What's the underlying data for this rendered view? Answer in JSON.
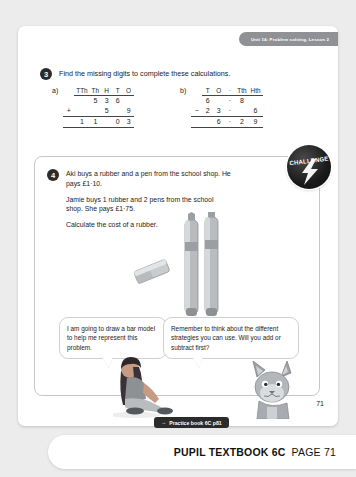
{
  "header": {
    "unit_tab": "Unit 14: Problem solving, Lesson 2"
  },
  "question3": {
    "number": "3",
    "prompt": "Find the missing digits to complete these calculations.",
    "parts": [
      {
        "label": "a)",
        "headers": [
          "TTh",
          "Th",
          "H",
          "T",
          "O"
        ],
        "rows": [
          {
            "op": "",
            "cells": [
              "",
              "5",
              "3",
              "6",
              ""
            ]
          },
          {
            "op": "+",
            "cells": [
              "",
              "",
              "5",
              "",
              "9"
            ]
          },
          {
            "op": "",
            "cells": [
              "1",
              "1",
              "",
              "0",
              "3"
            ]
          }
        ]
      },
      {
        "label": "b)",
        "headers": [
          "T",
          "O",
          "·",
          "Tth",
          "Hth"
        ],
        "rows": [
          {
            "op": "",
            "cells": [
              "6",
              "",
              "·",
              "8",
              ""
            ]
          },
          {
            "op": "−",
            "cells": [
              "2",
              "3",
              "·",
              "",
              "6"
            ]
          },
          {
            "op": "",
            "cells": [
              "",
              "6",
              "·",
              "2",
              "9"
            ]
          }
        ]
      }
    ]
  },
  "question4": {
    "number": "4",
    "paragraphs": [
      "Aki buys a rubber and a pen from the school shop. He pays £1·10.",
      "Jamie buys 1 rubber and 2 pens from the school shop. She pays £1·75.",
      "Calculate the cost of a rubber."
    ],
    "challenge_label": "CHALLENGE",
    "bubbles": [
      "I am going to draw a bar model to help me represent this problem.",
      "Remember to think about the different strategies you can use. Will you add or subtract first?"
    ]
  },
  "footer": {
    "page_number": "71",
    "practice_arrow": "→",
    "practice_label": "Practice book 6C p81",
    "book_title": "PUPIL TEXTBOOK 6C",
    "page_label": "PAGE 71"
  },
  "colors": {
    "background": "#ececed",
    "tab": "#8f9194",
    "badge": "#1a1a1a",
    "ink": "#1c1c1c"
  }
}
